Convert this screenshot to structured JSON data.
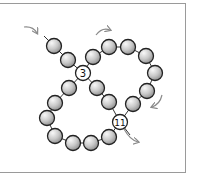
{
  "diagram": {
    "type": "beading-thread-path",
    "bead_fill_light": "#f4f4f4",
    "bead_fill_dark": "#9a9a9a",
    "bead_stroke": "#222222",
    "thread_color": "#333333",
    "arrow_color": "#8a8a8a",
    "labels": [
      {
        "text": "3",
        "x": 83,
        "y": 73
      },
      {
        "text": "11",
        "x": 120,
        "y": 122
      }
    ],
    "beads": [
      {
        "x": 54,
        "y": 46
      },
      {
        "x": 68,
        "y": 60
      },
      {
        "x": 93,
        "y": 57
      },
      {
        "x": 109,
        "y": 47
      },
      {
        "x": 128,
        "y": 47
      },
      {
        "x": 146,
        "y": 56
      },
      {
        "x": 155,
        "y": 73
      },
      {
        "x": 147,
        "y": 91
      },
      {
        "x": 133,
        "y": 104
      },
      {
        "x": 69,
        "y": 88
      },
      {
        "x": 97,
        "y": 88
      },
      {
        "x": 55,
        "y": 103
      },
      {
        "x": 109,
        "y": 102
      },
      {
        "x": 47,
        "y": 118
      },
      {
        "x": 55,
        "y": 136
      },
      {
        "x": 73,
        "y": 143
      },
      {
        "x": 91,
        "y": 143
      },
      {
        "x": 109,
        "y": 137
      }
    ],
    "arrows": [
      {
        "name": "arrow-entry",
        "d": "M24 27 Q33 26 37 33"
      },
      {
        "name": "arrow-top",
        "d": "M96 35 Q102 27 110 30"
      },
      {
        "name": "arrow-right",
        "d": "M162 95 Q160 104 152 107"
      },
      {
        "name": "arrow-exit",
        "d": "M124 129 Q130 140 138 142"
      }
    ]
  }
}
